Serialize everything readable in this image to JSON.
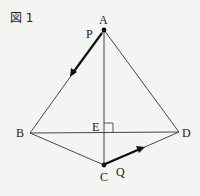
{
  "figure": {
    "title": "図 1",
    "points": {
      "A": {
        "label": "A",
        "x": 104,
        "y": 30
      },
      "B": {
        "label": "B",
        "x": 30,
        "y": 133
      },
      "C": {
        "label": "C",
        "x": 104,
        "y": 165
      },
      "D": {
        "label": "D",
        "x": 179,
        "y": 132
      },
      "E": {
        "label": "E",
        "x": 104,
        "y": 133
      }
    },
    "moving_points": {
      "P": {
        "label": "P",
        "on": "AB",
        "direction": "A→B"
      },
      "Q": {
        "label": "Q",
        "on": "CD",
        "direction": "C→D"
      }
    },
    "segments": [
      "AB",
      "AD",
      "AC",
      "BD",
      "BC",
      "CD"
    ],
    "right_angle_at": "E",
    "colors": {
      "line": "#333333",
      "background": "#f4f4f2"
    }
  }
}
